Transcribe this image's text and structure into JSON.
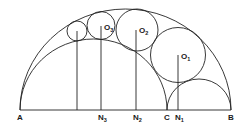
{
  "diagram": {
    "type": "arbelos-pappus-chain",
    "labels": {
      "A": "A",
      "B": "B",
      "C": "C",
      "N1": {
        "main": "N",
        "sub": "1"
      },
      "N2": {
        "main": "N",
        "sub": "2"
      },
      "N3": {
        "main": "N",
        "sub": "3"
      },
      "O1": {
        "main": "O",
        "sub": "1"
      },
      "O2": {
        "main": "O",
        "sub": "2"
      },
      "O3": {
        "main": "O",
        "sub": "3"
      }
    },
    "colors": {
      "line": "#222222",
      "background": "#ffffff"
    }
  }
}
